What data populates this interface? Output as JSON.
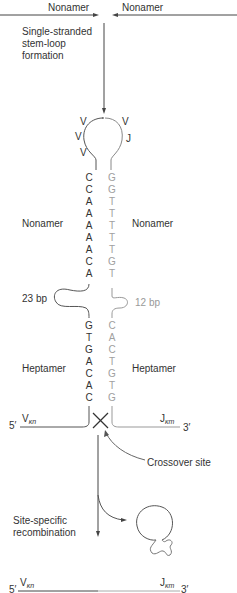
{
  "diagram": {
    "top": {
      "left_label": "Nonamer",
      "right_label": "Nonamer"
    },
    "step1_label_lines": [
      "Single-stranded",
      "stem-loop",
      "formation"
    ],
    "loop_labels": {
      "left": [
        "V",
        "V",
        "V"
      ],
      "right": [
        "V",
        "J"
      ]
    },
    "left_strand": {
      "nonamer": [
        "C",
        "C",
        "A",
        "A",
        "A",
        "A",
        "A",
        "C",
        "A"
      ],
      "heptamer": [
        "G",
        "T",
        "G",
        "A",
        "C",
        "A",
        "C"
      ],
      "nonamer_label": "Nonamer",
      "heptamer_label": "Heptamer",
      "spacer_label": "23 bp"
    },
    "right_strand": {
      "nonamer": [
        "G",
        "G",
        "T",
        "T",
        "T",
        "T",
        "T",
        "G",
        "T"
      ],
      "heptamer": [
        "C",
        "A",
        "C",
        "T",
        "G",
        "T",
        "G"
      ],
      "nonamer_label": "Nonamer",
      "heptamer_label": "Heptamer",
      "spacer_label": "12 bp"
    },
    "ends": {
      "five_prime": "5′",
      "three_prime": "3′",
      "v_gene": "V",
      "v_sub": "κn",
      "j_gene": "J",
      "j_sub": "κm"
    },
    "crossover_label": "Crossover site",
    "step2_label_lines": [
      "Site-specific",
      "recombination"
    ],
    "colors": {
      "dark_strand": "#444444",
      "light_strand": "#999999",
      "text": "#333333"
    }
  }
}
